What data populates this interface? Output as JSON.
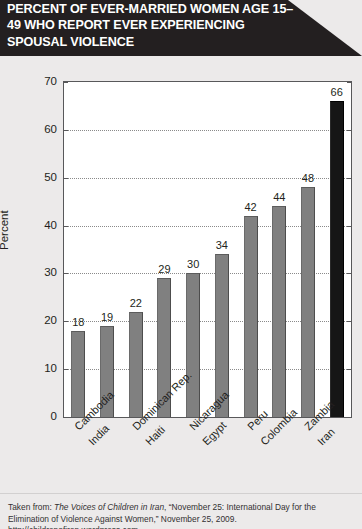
{
  "header": {
    "title": "PERCENT OF EVER-MARRIED WOMEN AGE 15–49 WHO REPORT EVER EXPERIENCING SPOUSAL VIOLENCE"
  },
  "footer": {
    "prefix": "Taken from: ",
    "source_title": "The Voices of Children in Iran",
    "suffix": ", “November 25: International Day for the Elimination of Violence Against Women,” November 25, 2009. http://childrenofiran.wordpress.com."
  },
  "chart_data": {
    "type": "bar",
    "title": "PERCENT OF EVER-MARRIED WOMEN AGE 15–49 WHO REPORT EVER EXPERIENCING SPOUSAL VIOLENCE",
    "xlabel": "",
    "ylabel": "Percent",
    "ylim": [
      0,
      70
    ],
    "yticks": [
      0,
      10,
      20,
      30,
      40,
      50,
      60,
      70
    ],
    "ytick_labels": [
      "0",
      "10",
      "20",
      "30",
      "40",
      "50",
      "60",
      "70"
    ],
    "grid": true,
    "legend": false,
    "categories": [
      "Cambodia",
      "India",
      "Dominican Rep.",
      "Haiti",
      "Nicaragua",
      "Egypt",
      "Peru",
      "Colombia",
      "Zambia",
      "Iran"
    ],
    "values": [
      18,
      19,
      22,
      29,
      30,
      34,
      42,
      44,
      48,
      66
    ],
    "value_labels": [
      "18",
      "19",
      "22",
      "29",
      "30",
      "34",
      "42",
      "44",
      "48",
      "66"
    ],
    "bar_colors": [
      "#808080",
      "#808080",
      "#808080",
      "#808080",
      "#808080",
      "#808080",
      "#808080",
      "#808080",
      "#808080",
      "#161616"
    ],
    "highlight_category": "Iran",
    "highlight_color": "#161616",
    "bar_color": "#808080"
  }
}
